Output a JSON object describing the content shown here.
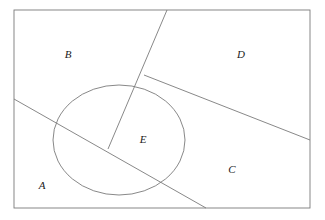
{
  "figure": {
    "background_color": "#ffffff",
    "stroke_color": "#7a7a7a",
    "label_color": "#1a1a1a",
    "stroke_width": 0.9,
    "canvas": {
      "width": 325,
      "height": 220
    }
  },
  "frame": {
    "name": "bounding-rectangle",
    "x": 14,
    "y": 10,
    "width": 296,
    "height": 198
  },
  "ellipse": {
    "name": "ellipse-E",
    "cx": 119,
    "cy": 140,
    "rx": 66,
    "ry": 55
  },
  "lines": [
    {
      "id": "steep-line",
      "name": "steep-diagonal-line",
      "x1": 167,
      "y1": 10,
      "x2": 108,
      "y2": 149
    },
    {
      "id": "long-diagonal",
      "name": "long-diagonal-line",
      "x1": 14,
      "y1": 99,
      "x2": 206,
      "y2": 208
    },
    {
      "id": "right-slant",
      "name": "right-slant-line",
      "x1": 144,
      "y1": 75,
      "x2": 310,
      "y2": 140
    }
  ],
  "labels": [
    {
      "id": "A",
      "text": "A",
      "x": 42,
      "y": 186
    },
    {
      "id": "B",
      "text": "B",
      "x": 68,
      "y": 55
    },
    {
      "id": "C",
      "text": "C",
      "x": 232,
      "y": 170
    },
    {
      "id": "D",
      "text": "D",
      "x": 241,
      "y": 55
    },
    {
      "id": "E",
      "text": "E",
      "x": 143,
      "y": 140
    }
  ]
}
